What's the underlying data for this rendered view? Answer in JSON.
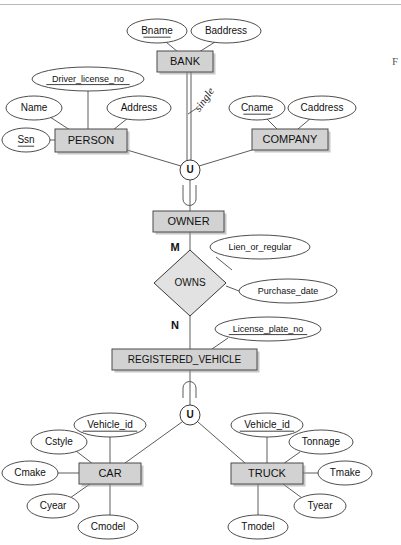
{
  "figure": {
    "caption_fragment": "F",
    "background_color": "#ffffff",
    "entity_fill_color": "#d2d2d2",
    "relationship_fill_color": "#e2e2e2",
    "attribute_fill_color": "#ffffff",
    "line_color": "#4a4a4a"
  },
  "entities": [
    {
      "id": "bank",
      "label": "BANK",
      "x": 157,
      "y": 51,
      "w": 56,
      "h": 21
    },
    {
      "id": "person",
      "label": "PERSON",
      "x": 55,
      "y": 129,
      "w": 72,
      "h": 23
    },
    {
      "id": "company",
      "label": "COMPANY",
      "x": 252,
      "y": 129,
      "w": 76,
      "h": 21
    },
    {
      "id": "owner",
      "label": "OWNER",
      "x": 153,
      "y": 211,
      "w": 71,
      "h": 21
    },
    {
      "id": "regveh",
      "label": "REGISTERED_VEHICLE",
      "x": 112,
      "y": 349,
      "w": 145,
      "h": 21
    },
    {
      "id": "car",
      "label": "CAR",
      "x": 79,
      "y": 463,
      "w": 62,
      "h": 21
    },
    {
      "id": "truck",
      "label": "TRUCK",
      "x": 231,
      "y": 463,
      "w": 72,
      "h": 21
    }
  ],
  "relationships": [
    {
      "id": "owns",
      "label": "OWNS",
      "cx": 190,
      "cy": 283,
      "rx": 36,
      "ry": 33
    }
  ],
  "union_nodes": [
    {
      "id": "u-owner",
      "label": "U",
      "cx": 190,
      "cy": 170,
      "r": 10,
      "subset_position": "below"
    },
    {
      "id": "u-vehicle",
      "label": "U",
      "cx": 190,
      "cy": 415,
      "r": 10,
      "subset_position": "above"
    }
  ],
  "attributes": [
    {
      "id": "bname",
      "label": "Bname",
      "owner": "bank",
      "cx": 157,
      "cy": 31,
      "rx": 30,
      "ry": 12,
      "key": true
    },
    {
      "id": "baddress",
      "label": "Baddress",
      "owner": "bank",
      "cx": 226,
      "cy": 31,
      "rx": 35,
      "ry": 12,
      "key": false
    },
    {
      "id": "driver_license_no",
      "label": "Driver_license_no",
      "owner": "person",
      "cx": 88,
      "cy": 79,
      "rx": 56,
      "ry": 12,
      "key": true
    },
    {
      "id": "name",
      "label": "Name",
      "owner": "person",
      "cx": 34,
      "cy": 108,
      "rx": 28,
      "ry": 12,
      "key": false
    },
    {
      "id": "address",
      "label": "Address",
      "owner": "person",
      "cx": 139,
      "cy": 108,
      "rx": 32,
      "ry": 12,
      "key": false
    },
    {
      "id": "ssn",
      "label": "Ssn",
      "owner": "person",
      "cx": 26,
      "cy": 140,
      "rx": 24,
      "ry": 12,
      "key": true
    },
    {
      "id": "cname",
      "label": "Cname",
      "owner": "company",
      "cx": 257,
      "cy": 108,
      "rx": 28,
      "ry": 12,
      "key": true
    },
    {
      "id": "caddress",
      "label": "Caddress",
      "owner": "company",
      "cx": 322,
      "cy": 108,
      "rx": 34,
      "ry": 12,
      "key": false
    },
    {
      "id": "lien_or_regular",
      "label": "Lien_or_regular",
      "owner": "owns",
      "cx": 260,
      "cy": 247,
      "rx": 50,
      "ry": 12,
      "key": false
    },
    {
      "id": "purchase_date",
      "label": "Purchase_date",
      "owner": "owns",
      "cx": 288,
      "cy": 291,
      "rx": 49,
      "ry": 12,
      "key": false
    },
    {
      "id": "license_plate_no",
      "label": "License_plate_no",
      "owner": "regveh",
      "cx": 268,
      "cy": 329,
      "rx": 53,
      "ry": 12,
      "key": true
    },
    {
      "id": "car_vehicle_id",
      "label": "Vehicle_id",
      "owner": "car",
      "cx": 110,
      "cy": 425,
      "rx": 36,
      "ry": 12,
      "key": true
    },
    {
      "id": "cstyle",
      "label": "Cstyle",
      "owner": "car",
      "cx": 59,
      "cy": 442,
      "rx": 28,
      "ry": 12,
      "key": false
    },
    {
      "id": "cmake",
      "label": "Cmake",
      "owner": "car",
      "cx": 30,
      "cy": 473,
      "rx": 28,
      "ry": 12,
      "key": false
    },
    {
      "id": "cyear",
      "label": "Cyear",
      "owner": "car",
      "cx": 53,
      "cy": 506,
      "rx": 26,
      "ry": 12,
      "key": false
    },
    {
      "id": "cmodel",
      "label": "Cmodel",
      "owner": "car",
      "cx": 108,
      "cy": 527,
      "rx": 30,
      "ry": 12,
      "key": false
    },
    {
      "id": "truck_vehicle_id",
      "label": "Vehicle_id",
      "owner": "truck",
      "cx": 267,
      "cy": 425,
      "rx": 36,
      "ry": 12,
      "key": true
    },
    {
      "id": "tonnage",
      "label": "Tonnage",
      "owner": "truck",
      "cx": 321,
      "cy": 442,
      "rx": 32,
      "ry": 12,
      "key": false
    },
    {
      "id": "tmake",
      "label": "Tmake",
      "owner": "truck",
      "cx": 345,
      "cy": 473,
      "rx": 27,
      "ry": 12,
      "key": false
    },
    {
      "id": "tyear",
      "label": "Tyear",
      "owner": "truck",
      "cx": 320,
      "cy": 506,
      "rx": 26,
      "ry": 12,
      "key": false
    },
    {
      "id": "tmodel",
      "label": "Tmodel",
      "owner": "truck",
      "cx": 258,
      "cy": 527,
      "rx": 30,
      "ry": 12,
      "key": false
    }
  ],
  "cardinality_labels": [
    {
      "id": "card-m",
      "label": "M",
      "x": 175,
      "y": 248
    },
    {
      "id": "card-n",
      "label": "N",
      "x": 175,
      "y": 326
    }
  ],
  "annotations": [
    {
      "id": "single-note",
      "label": "single",
      "x": 205,
      "y": 100,
      "rotation": -55,
      "handwritten": true
    }
  ],
  "legend": {
    "key_attributes": [
      "Bname",
      "Driver_license_no",
      "Ssn",
      "Cname",
      "License_plate_no",
      "Vehicle_id"
    ],
    "union_symbol": "U",
    "cardinality_notation": "M:N"
  }
}
